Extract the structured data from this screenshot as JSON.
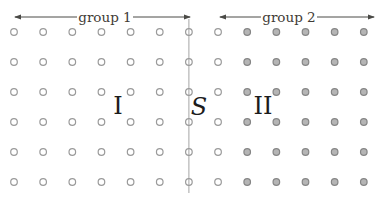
{
  "diagram": {
    "width": 382,
    "height": 198,
    "background": "#ffffff",
    "colors": {
      "open_dot_fill": "#ffffff",
      "open_dot_stroke": "#9a9a9a",
      "filled_dot_fill": "#b5b5b5",
      "filled_dot_stroke": "#858585",
      "boundary_line": "#9a9a9a",
      "arrow": "#4a4a46",
      "arrow_text": "#3f3b36",
      "region_label": "#1c1c1c"
    },
    "grid": {
      "columns": 13,
      "rows": 6,
      "x_start": 14,
      "x_step": 29.15,
      "y_start": 32,
      "y_step": 30,
      "dot_radius": 3.3,
      "dot_stroke_width": 1.2,
      "filled_from_column": 8
    },
    "boundary_line": {
      "x": 188.9,
      "y1": 19,
      "y2": 193,
      "stroke_width": 0.9
    },
    "span_arrows": [
      {
        "label": "group 1",
        "x1": 14,
        "x2": 191,
        "y": 17,
        "text_x": 105,
        "text_gap_half": 28
      },
      {
        "label": "group 2",
        "x1": 219,
        "x2": 375,
        "y": 17,
        "text_x": 289,
        "text_gap_half": 28
      }
    ],
    "region_labels": [
      {
        "text": "I",
        "x": 118,
        "y": 114,
        "italic": false,
        "font_size": 24
      },
      {
        "text": "S",
        "x": 199,
        "y": 115,
        "italic": true,
        "font_size": 24
      },
      {
        "text": "II",
        "x": 263,
        "y": 114,
        "italic": false,
        "font_size": 24
      }
    ],
    "arrow_label_font_size": 13.5,
    "arrow_head": {
      "length": 7,
      "half_width": 2.6
    }
  }
}
